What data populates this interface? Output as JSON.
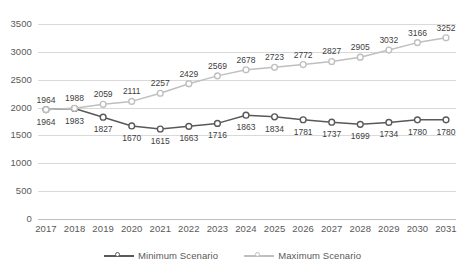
{
  "chart_data": {
    "type": "line",
    "title": "",
    "xlabel": "",
    "ylabel": "",
    "grid": true,
    "legend_position": "bottom",
    "ylim": [
      0,
      3500
    ],
    "ytick_values": [
      0,
      500,
      1000,
      1500,
      2000,
      2500,
      3000,
      3500
    ],
    "ytick_labels": [
      "0",
      "500",
      "1000",
      "1500",
      "2000",
      "2500",
      "3000",
      "3500"
    ],
    "categories": [
      "2017",
      "2018",
      "2019",
      "2020",
      "2021",
      "2022",
      "2023",
      "2024",
      "2025",
      "2026",
      "2027",
      "2028",
      "2029",
      "2030",
      "2031"
    ],
    "series": [
      {
        "name": "Minimum Scenario",
        "color": "#595959",
        "marker": "circle",
        "values": [
          1964,
          1983,
          1827,
          1670,
          1615,
          1663,
          1716,
          1863,
          1834,
          1781,
          1737,
          1699,
          1734,
          1780,
          1780
        ],
        "labels": [
          "1964",
          "1983",
          "1827",
          "1670",
          "1615",
          "1663",
          "1716",
          "1863",
          "1834",
          "1781",
          "1737",
          "1699",
          "1734",
          "1780",
          "1780"
        ]
      },
      {
        "name": "Maximum Scenario",
        "color": "#bfbfbf",
        "marker": "circle",
        "values": [
          1964,
          1988,
          2059,
          2111,
          2257,
          2429,
          2569,
          2678,
          2723,
          2772,
          2827,
          2905,
          3032,
          3166,
          3252
        ],
        "labels": [
          "1964",
          "1988",
          "2059",
          "2111",
          "2257",
          "2429",
          "2569",
          "2678",
          "2723",
          "2772",
          "2827",
          "2905",
          "3032",
          "3166",
          "3252"
        ]
      }
    ]
  },
  "legend": {
    "items": [
      {
        "label": "Minimum Scenario",
        "color": "#595959"
      },
      {
        "label": "Maximum Scenario",
        "color": "#bfbfbf"
      }
    ]
  },
  "colors": {
    "minimum": "#595959",
    "maximum": "#bfbfbf",
    "grid": "#d9d9d9",
    "text": "#595959",
    "background": "#ffffff"
  }
}
